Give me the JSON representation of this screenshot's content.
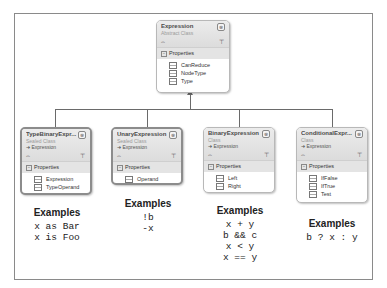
{
  "root_class": {
    "name": "Expression",
    "kind": "Abstract Class",
    "section": "Properties",
    "properties": [
      "CanReduce",
      "NodeType",
      "Type"
    ]
  },
  "subclasses": [
    {
      "name": "TypeBinaryExpr...",
      "kind": "Sealed Class",
      "base": "Expression",
      "section": "Properties",
      "properties": [
        "Expression",
        "TypeOperand"
      ],
      "examples_title": "Examples",
      "examples": [
        "x as Bar",
        "x is Foo"
      ]
    },
    {
      "name": "UnaryExpression",
      "kind": "Sealed Class",
      "base": "Expression",
      "section": "Properties",
      "properties": [
        "Operand"
      ],
      "examples_title": "Examples",
      "examples": [
        "!b",
        "-x"
      ]
    },
    {
      "name": "BinaryExpression",
      "kind": "Class",
      "base": "Expression",
      "section": "Properties",
      "properties": [
        "Left",
        "Right"
      ],
      "examples_title": "Examples",
      "examples": [
        "x + y",
        "b && c",
        "x < y",
        "x == y"
      ]
    },
    {
      "name": "ConditionalExpr...",
      "kind": "Class",
      "base": "Expression",
      "section": "Properties",
      "properties": [
        "IfFalse",
        "IfTrue",
        "Test"
      ],
      "examples_title": "Examples",
      "examples": [
        "b ? x : y"
      ]
    }
  ],
  "icons": {
    "collapse": "⊗",
    "section_toggle": "−",
    "base_arrow": "➜",
    "expand_toggle": "⌓",
    "filter": "⊤"
  },
  "colors": {
    "frame_border": "#8a8a8a",
    "header_bg": "#e0e0e0",
    "line": "#6a6a6a"
  }
}
